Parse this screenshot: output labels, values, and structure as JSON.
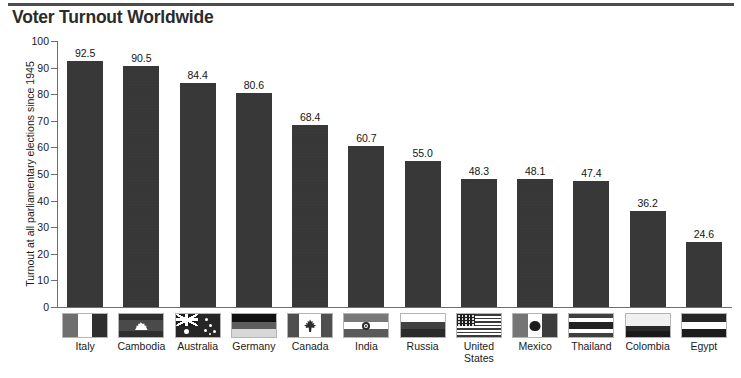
{
  "header": {
    "title": "Voter Turnout Worldwide"
  },
  "chart_data": {
    "type": "bar",
    "title": "Voter Turnout Worldwide",
    "xlabel": "",
    "ylabel": "Turnout at all parliamentary elections since 1945",
    "ylim": [
      0,
      100
    ],
    "ytick_labels": [
      "100",
      "90",
      "80",
      "70",
      "60",
      "50",
      "40",
      "30",
      "20",
      "10",
      "0"
    ],
    "yticks": [
      100,
      90,
      80,
      70,
      60,
      50,
      40,
      30,
      20,
      10,
      0
    ],
    "grid": false,
    "legend": null,
    "categories": [
      "Italy",
      "Cambodia",
      "Australia",
      "Germany",
      "Canada",
      "India",
      "Russia",
      "United States",
      "Mexico",
      "Thailand",
      "Colombia",
      "Egypt"
    ],
    "values": [
      92.5,
      90.5,
      84.4,
      80.6,
      68.4,
      60.7,
      55.0,
      48.3,
      48.1,
      47.4,
      36.2,
      24.6
    ],
    "value_labels": [
      "92.5",
      "90.5",
      "84.4",
      "80.6",
      "68.4",
      "60.7",
      "55.0",
      "48.3",
      "48.1",
      "47.4",
      "36.2",
      "24.6"
    ],
    "category_labels_wrapped": [
      [
        "Italy"
      ],
      [
        "Cambodia"
      ],
      [
        "Australia"
      ],
      [
        "Germany"
      ],
      [
        "Canada"
      ],
      [
        "India"
      ],
      [
        "Russia"
      ],
      [
        "United",
        "States"
      ],
      [
        "Mexico"
      ],
      [
        "Thailand"
      ],
      [
        "Colombia"
      ],
      [
        "Egypt"
      ]
    ],
    "flag_icons": [
      "flag-italy",
      "flag-cambodia",
      "flag-australia",
      "flag-germany",
      "flag-canada",
      "flag-india",
      "flag-russia",
      "flag-united-states",
      "flag-mexico",
      "flag-thailand",
      "flag-colombia",
      "flag-egypt"
    ],
    "bar_color": "#363636",
    "axis_color": "#6e6e6e",
    "background_color": "#ffffff"
  }
}
